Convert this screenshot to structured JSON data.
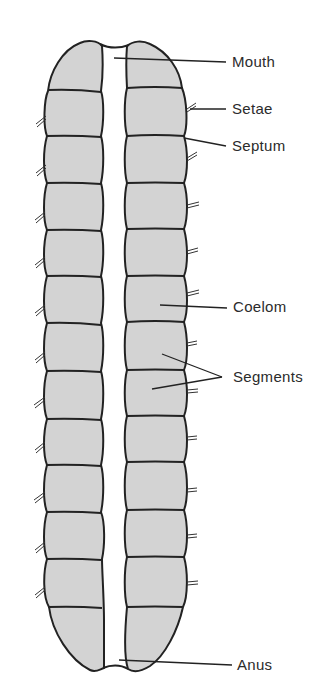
{
  "figure": {
    "colors": {
      "segment_fill": "#d3d3d3",
      "outline": "#222222",
      "leader": "#222222",
      "background": "#ffffff"
    }
  },
  "labels": {
    "mouth": "Mouth",
    "setae": "Setae",
    "septum": "Septum",
    "coelom": "Coelom",
    "segments": "Segments",
    "anus": "Anus"
  },
  "structure": {
    "segment_count_per_side": 13,
    "left_septa_y": [
      91,
      136,
      183,
      230,
      276,
      323,
      371,
      419,
      465,
      512,
      559,
      607
    ],
    "right_septa_y": [
      88,
      136,
      183,
      229,
      276,
      322,
      370,
      416,
      462,
      510,
      557,
      607
    ]
  }
}
